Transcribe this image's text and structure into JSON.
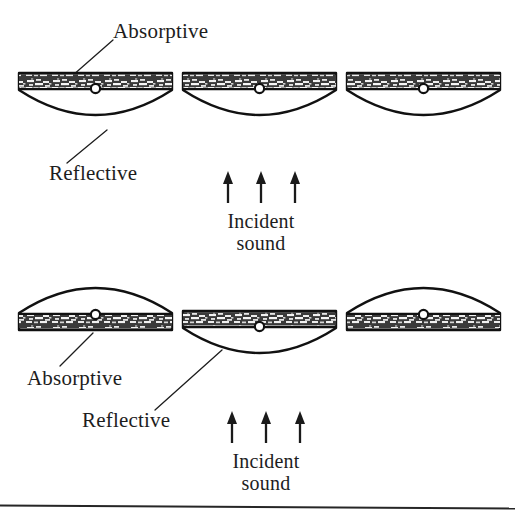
{
  "figure": {
    "background_color": "#ffffff",
    "ink_color": "#1a1a1a",
    "width": 515,
    "height": 518
  },
  "rows": [
    {
      "id": "row-top",
      "description": "All three panels rotated absorptive-side-up; reflective convex arc faces downward.",
      "labels": {
        "absorptive": "Absorptive",
        "reflective": "Reflective",
        "incident_line1": "Incident",
        "incident_line2": "sound"
      },
      "panels": [
        {
          "id": "top-panel-1",
          "orientation": "absorptive-up",
          "face_up": "absorptive",
          "face_down": "reflective"
        },
        {
          "id": "top-panel-2",
          "orientation": "absorptive-up",
          "face_up": "absorptive",
          "face_down": "reflective"
        },
        {
          "id": "top-panel-3",
          "orientation": "absorptive-up",
          "face_up": "absorptive",
          "face_down": "reflective"
        }
      ],
      "arrow_count": 3,
      "arrow_direction": "up"
    },
    {
      "id": "row-bottom",
      "description": "Outer panels rotated reflective-side-up; centre panel remains absorptive-side-up.",
      "labels": {
        "absorptive": "Absorptive",
        "reflective": "Reflective",
        "incident_line1": "Incident",
        "incident_line2": "sound"
      },
      "panels": [
        {
          "id": "bottom-panel-1",
          "orientation": "reflective-up",
          "face_up": "reflective",
          "face_down": "absorptive"
        },
        {
          "id": "bottom-panel-2",
          "orientation": "absorptive-up",
          "face_up": "absorptive",
          "face_down": "reflective"
        },
        {
          "id": "bottom-panel-3",
          "orientation": "reflective-up",
          "face_up": "reflective",
          "face_down": "absorptive"
        }
      ],
      "arrow_count": 3,
      "arrow_direction": "up"
    }
  ],
  "icons": {
    "pivot": "pivot-circle-icon",
    "arrow": "up-arrow-icon"
  },
  "footer": {
    "rule": "horizontal-rule"
  }
}
